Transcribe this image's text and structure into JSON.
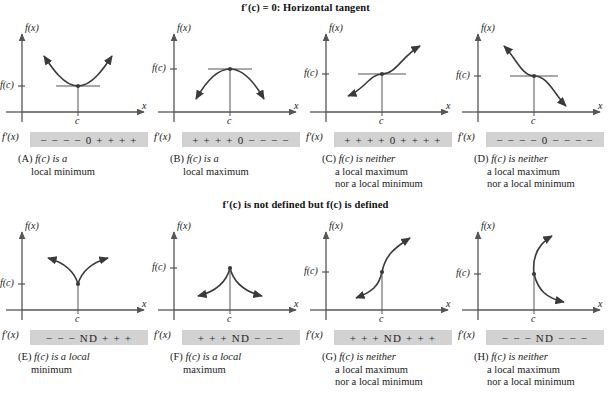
{
  "figure": {
    "title_top": "f′(c) = 0: Horizontal tangent",
    "title_bottom": "f′(c) is not defined but f(c) is defined",
    "axis_y_label": "f(x)",
    "axis_x_label": "x",
    "value_label": "f(c)",
    "critical_point_label": "c",
    "derivative_label": "f′(x)",
    "signbar_color": "#d2d2d2",
    "curve_color": "#3a3a3a"
  },
  "panels": [
    {
      "id": "A",
      "tag": "(A)",
      "shape": "parabola-up",
      "sign_chart": "− − − − 0 + + + +",
      "caption_lines": [
        "f(c) is a",
        "local minimum"
      ],
      "axis_y_label": "f(x)",
      "axis_x_label": "x",
      "value_label": "f(c)",
      "critical_point_label": "c",
      "derivative_label": "f′(x)"
    },
    {
      "id": "B",
      "tag": "(B)",
      "shape": "parabola-down",
      "sign_chart": "+ + + + 0 − − − −",
      "caption_lines": [
        "f(c) is a",
        "local maximum"
      ],
      "axis_y_label": "f(x)",
      "axis_x_label": "x",
      "value_label": "f(c)",
      "critical_point_label": "c",
      "derivative_label": "f′(x)"
    },
    {
      "id": "C",
      "tag": "(C)",
      "shape": "inflection-increasing",
      "sign_chart": "+ + + + 0 + + + +",
      "caption_lines": [
        "f(c) is neither",
        "a local maximum",
        "nor a local minimum"
      ],
      "axis_y_label": "f(x)",
      "axis_x_label": "x",
      "value_label": "f(c)",
      "critical_point_label": "c",
      "derivative_label": "f′(x)"
    },
    {
      "id": "D",
      "tag": "(D)",
      "shape": "inflection-decreasing",
      "sign_chart": "− − − − 0 − − − −",
      "caption_lines": [
        "f(c) is neither",
        "a local maximum",
        "nor a local minimum"
      ],
      "axis_y_label": "f(x)",
      "axis_x_label": "x",
      "value_label": "f(c)",
      "critical_point_label": "c",
      "derivative_label": "f′(x)"
    },
    {
      "id": "E",
      "tag": "(E)",
      "shape": "cusp-up",
      "sign_chart": "− − − ND + + +",
      "caption_lines": [
        "f(c) is a local",
        "minimum"
      ],
      "axis_y_label": "f(x)",
      "axis_x_label": "x",
      "value_label": "f(c)",
      "critical_point_label": "c",
      "derivative_label": "f′(x)"
    },
    {
      "id": "F",
      "tag": "(F)",
      "shape": "cusp-down",
      "sign_chart": "+ + + ND − − −",
      "caption_lines": [
        "f(c) is a local",
        "maximum"
      ],
      "axis_y_label": "f(x)",
      "axis_x_label": "x",
      "value_label": "f(c)",
      "critical_point_label": "c",
      "derivative_label": "f′(x)"
    },
    {
      "id": "G",
      "tag": "(G)",
      "shape": "vertical-tangent-increasing",
      "sign_chart": "+ + + ND + + +",
      "caption_lines": [
        "f(c) is neither",
        "a local maximum",
        "nor a local minimum"
      ],
      "axis_y_label": "f(x)",
      "axis_x_label": "x",
      "value_label": "f(c)",
      "critical_point_label": "c",
      "derivative_label": "f′(x)"
    },
    {
      "id": "H",
      "tag": "(H)",
      "shape": "vertical-tangent-decreasing",
      "sign_chart": "− − − ND − − −",
      "caption_lines": [
        "f(c) is neither",
        "a local maximum",
        "nor a local minimum"
      ],
      "axis_y_label": "f(x)",
      "axis_x_label": "x",
      "value_label": "f(c)",
      "critical_point_label": "c",
      "derivative_label": "f′(x)"
    }
  ]
}
